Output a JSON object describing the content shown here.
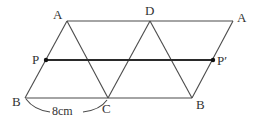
{
  "diagram": {
    "type": "geometry-figure",
    "stroke_color": "#4a4a4a",
    "points": {
      "A_left": {
        "label": "A",
        "x": 67,
        "y": 21
      },
      "D": {
        "label": "D",
        "x": 150,
        "y": 21
      },
      "A_right": {
        "label": "A",
        "x": 233,
        "y": 21
      },
      "B_left": {
        "label": "B",
        "x": 25,
        "y": 98
      },
      "C": {
        "label": "C",
        "x": 108,
        "y": 98
      },
      "B_right": {
        "label": "B",
        "x": 192,
        "y": 98
      },
      "P": {
        "label": "P",
        "x": 46,
        "y": 60
      },
      "P_prime": {
        "label": "P′",
        "x": 213,
        "y": 60
      }
    },
    "segments": [
      [
        "A_left",
        "A_right"
      ],
      [
        "B_left",
        "B_right"
      ],
      [
        "A_left",
        "B_left"
      ],
      [
        "A_right",
        "B_right"
      ],
      [
        "A_left",
        "C"
      ],
      [
        "D",
        "C"
      ],
      [
        "D",
        "B_right"
      ],
      [
        "P",
        "P_prime"
      ]
    ],
    "measurements": {
      "BC": "8cm"
    }
  }
}
